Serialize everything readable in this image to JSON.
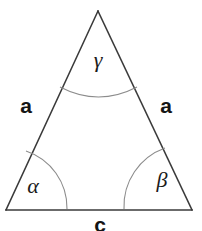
{
  "figure": {
    "canvas": {
      "width": 202,
      "height": 231,
      "background": "#ffffff"
    },
    "colors": {
      "edge_stroke": "#3a3a3a",
      "arc_stroke": "#8c8c8c",
      "label_text": "#141414",
      "angle_text": "#1a1a1a",
      "background": "#ffffff"
    },
    "shape": {
      "type": "isosceles-triangle",
      "vertices": {
        "apex": {
          "x": 98,
          "y": 11
        },
        "bottom_left": {
          "x": 6,
          "y": 210
        },
        "bottom_right": {
          "x": 192,
          "y": 210
        }
      },
      "edge_stroke_width": 1.5
    },
    "side_labels": {
      "left": "a",
      "right": "a",
      "base": "c"
    },
    "angle_labels": {
      "apex": "γ",
      "bottom_left": "α",
      "bottom_right": "β"
    },
    "label_positions": {
      "left_side": {
        "x": 26,
        "y": 107
      },
      "right_side": {
        "x": 166,
        "y": 107
      },
      "base": {
        "x": 100,
        "y": 226
      },
      "apex_angle": {
        "x": 98,
        "y": 62
      },
      "bottom_left_angle": {
        "x": 33,
        "y": 188
      },
      "bottom_right_angle": {
        "x": 162,
        "y": 182
      }
    },
    "arcs": {
      "apex": {
        "start_x": 60,
        "start_y": 87,
        "end_x": 137,
        "end_y": 87,
        "sag": 10
      },
      "bottom_left": {
        "start_x": 26,
        "start_y": 151,
        "end_x": 67,
        "end_y": 209,
        "radius": 60
      },
      "bottom_right": {
        "start_x": 124,
        "start_y": 209,
        "end_x": 165,
        "end_y": 148,
        "radius": 62
      }
    }
  }
}
